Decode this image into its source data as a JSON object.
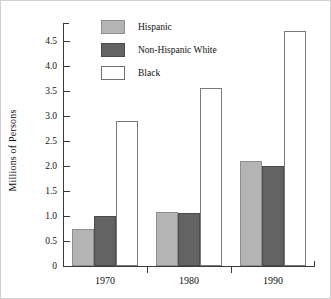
{
  "chart_data": {
    "type": "bar",
    "title": "",
    "xlabel": "",
    "ylabel": "Millions of Persons",
    "categories": [
      "1970",
      "1980",
      "1990"
    ],
    "series": [
      {
        "name": "Hispanic",
        "color": "#b4b4b4",
        "values": [
          0.73,
          1.08,
          2.1
        ]
      },
      {
        "name": "Non-Hispanic White",
        "color": "#636363",
        "values": [
          1.0,
          1.05,
          2.0
        ]
      },
      {
        "name": "Black",
        "color": "#ffffff",
        "values": [
          2.9,
          3.55,
          4.7
        ]
      }
    ],
    "ylim": [
      0,
      4.85
    ],
    "yticks": [
      0,
      0.5,
      1.0,
      1.5,
      2.0,
      2.5,
      3.0,
      3.5,
      4.0,
      4.5
    ],
    "ytick_labels": [
      "0",
      "0.5",
      "1.0",
      "1.5",
      "2.0",
      "2.5",
      "3.0",
      "3.5",
      "4.0",
      "4.5"
    ],
    "grid": false,
    "legend_position": "top-left-inside"
  },
  "legend": {
    "entries": [
      {
        "label": "Hispanic"
      },
      {
        "label": "Non-Hispanic White"
      },
      {
        "label": "Black"
      }
    ]
  }
}
